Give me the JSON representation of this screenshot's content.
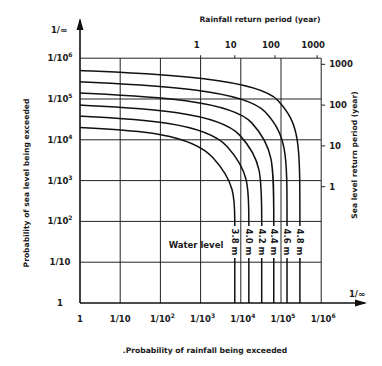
{
  "chart_data": {
    "type": "line",
    "title": "",
    "xlabel": "Probability of rainfall being exceeded",
    "ylabel": "Probability of sea level being exceeded",
    "x2label": "Rainfall return period (year)",
    "y2label": "Sea level return period (year)",
    "x_ticks": [
      "1",
      "1/10",
      "1/10^2",
      "1/10^3",
      "1/10^4",
      "1/10^5",
      "1/10^6"
    ],
    "x_end_label": "1/∞",
    "y_ticks": [
      "1",
      "1/10",
      "1/10^2",
      "1/10^3",
      "1/10^4",
      "1/10^5",
      "1/10^6"
    ],
    "y_end_label": "1/∞",
    "x2_ticks": [
      {
        "label": "1",
        "at_log10": 3
      },
      {
        "label": "10",
        "at_log10": 3.85
      },
      {
        "label": "100",
        "at_log10": 4.85
      },
      {
        "label": "1000",
        "at_log10": 5.9
      }
    ],
    "y2_ticks": [
      {
        "label": "1000",
        "at_log10": 5.85
      },
      {
        "label": "100",
        "at_log10": 4.85
      },
      {
        "label": "10",
        "at_log10": 3.85
      },
      {
        "label": "1",
        "at_log10": 2.85
      }
    ],
    "annotation": "Water level",
    "grid": true,
    "series": [
      {
        "name": "3.8 m",
        "y_start_log10": 4.3,
        "x_asym_log10": 3.85
      },
      {
        "name": "4.0 m",
        "y_start_log10": 4.58,
        "x_asym_log10": 4.2
      },
      {
        "name": "4.2 m",
        "y_start_log10": 4.85,
        "x_asym_log10": 4.52
      },
      {
        "name": "4.4 m",
        "y_start_log10": 5.15,
        "x_asym_log10": 4.82
      },
      {
        "name": "4.6 m",
        "y_start_log10": 5.42,
        "x_asym_log10": 5.15
      },
      {
        "name": "4.8 m",
        "y_start_log10": 5.7,
        "x_asym_log10": 5.47
      }
    ]
  }
}
